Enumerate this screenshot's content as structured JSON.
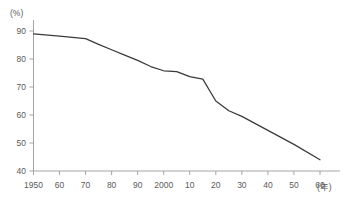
{
  "chart_data": {
    "type": "line",
    "title": "",
    "subtitle": "",
    "xlabel": "(年)",
    "ylabel": "(%)",
    "grid": false,
    "legend": "none",
    "xlim": [
      1950,
      2060
    ],
    "ylim": [
      40,
      90
    ],
    "x_tick_labels": [
      "1950",
      "60",
      "70",
      "80",
      "90",
      "2000",
      "10",
      "20",
      "30",
      "40",
      "50",
      "60"
    ],
    "x_tick_values": [
      1950,
      1960,
      1970,
      1980,
      1990,
      2000,
      2010,
      2020,
      2030,
      2040,
      2050,
      2060
    ],
    "y_tick_labels": [
      "40",
      "50",
      "60",
      "70",
      "80",
      "90"
    ],
    "y_tick_values": [
      40,
      50,
      60,
      70,
      80,
      90
    ],
    "series": [
      {
        "name": "",
        "x": [
          1950,
          1960,
          1970,
          1975,
          1980,
          1985,
          1990,
          1995,
          2000,
          2005,
          2010,
          2015,
          2020,
          2025,
          2030,
          2040,
          2050,
          2060
        ],
        "values": [
          89.0,
          88.2,
          87.3,
          85.2,
          83.3,
          81.4,
          79.5,
          77.3,
          75.8,
          75.5,
          73.7,
          72.8,
          65.0,
          61.5,
          59.5,
          54.5,
          49.5,
          44.0
        ]
      }
    ],
    "line_color": "#3a3a3a",
    "axis_color": "#9a9a9a",
    "text_color": "#5a5a5a",
    "background_color": "#ffffff"
  },
  "axis_labels": {
    "y_unit": "(%)",
    "x_unit": "(年)"
  }
}
